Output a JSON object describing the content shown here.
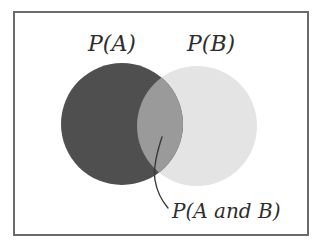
{
  "diagram": {
    "type": "venn",
    "labels": {
      "set_a": "P(A)",
      "set_b": "P(B)",
      "intersection": "P(A and B)"
    },
    "colors": {
      "set_a_fill": "#4f4f4f",
      "set_b_fill": "#e4e4e4",
      "intersection_fill": "#9a9a9a",
      "border": "#6b6b6b",
      "text": "#2e2e2e",
      "pointer": "#3a3a3a"
    },
    "circles": {
      "a": {
        "cx": 122,
        "cy": 124,
        "r": 61
      },
      "b": {
        "cx": 197,
        "cy": 126,
        "r": 60
      }
    }
  }
}
